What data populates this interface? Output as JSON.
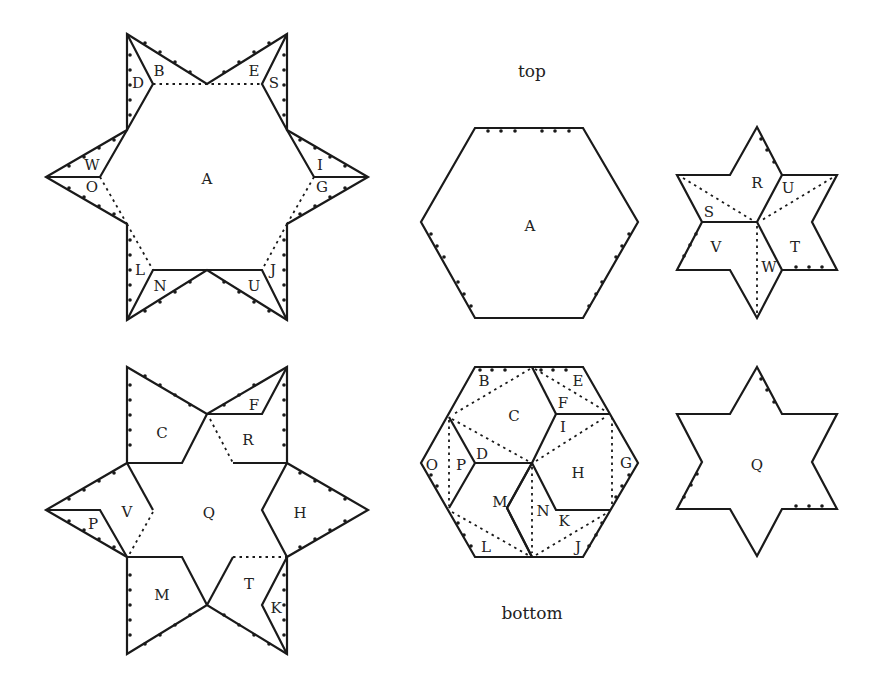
{
  "captions": {
    "top": "top",
    "bottom": "bottom"
  },
  "top_star": {
    "center_label": "A",
    "labels": [
      "B",
      "D",
      "E",
      "S",
      "W",
      "O",
      "I",
      "G",
      "L",
      "N",
      "U",
      "J"
    ]
  },
  "hex_top": {
    "label": "A"
  },
  "small_star_top": {
    "labels": [
      "R",
      "U",
      "S",
      "V",
      "T",
      "W"
    ]
  },
  "bottom_star": {
    "labels": [
      "C",
      "F",
      "R",
      "V",
      "P",
      "Q",
      "H",
      "M",
      "T",
      "K"
    ]
  },
  "hex_bottom": {
    "labels": [
      "B",
      "E",
      "C",
      "F",
      "I",
      "O",
      "P",
      "D",
      "H",
      "G",
      "M",
      "N",
      "K",
      "L",
      "J"
    ]
  },
  "small_star_bottom": {
    "label": "Q"
  }
}
